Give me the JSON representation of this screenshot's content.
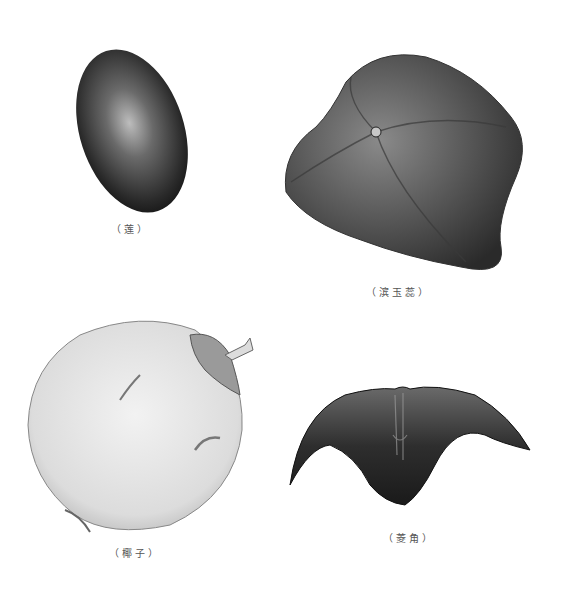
{
  "plate": {
    "description": "Botanical illustration plate of four floating seeds/fruits",
    "figures": [
      {
        "id": "lotus",
        "caption": "（莲）",
        "color": "#2a2a2a"
      },
      {
        "id": "barringtonia",
        "caption": "（滨玉蕊）",
        "color": "#3a3a3a"
      },
      {
        "id": "coconut",
        "caption": "（椰子）",
        "color": "#e4e4e4"
      },
      {
        "id": "water-caltrop",
        "caption": "（菱角）",
        "color": "#262626"
      }
    ]
  }
}
